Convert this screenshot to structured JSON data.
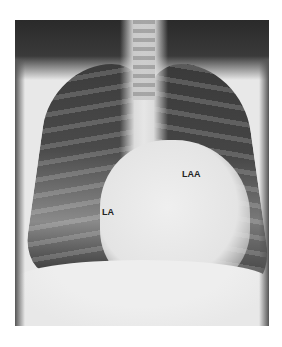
{
  "figure": {
    "type": "chest-radiograph",
    "view": "posteroanterior",
    "labels": [
      {
        "text": "LA",
        "meaning": "left atrium"
      },
      {
        "text": "LAA",
        "meaning": "left atrial appendage"
      }
    ]
  }
}
